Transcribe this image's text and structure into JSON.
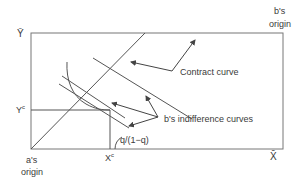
{
  "diagram": {
    "type": "edgeworth-box",
    "colors": {
      "line": "#555555",
      "text": "#3a3a3a",
      "background": "#ffffff"
    },
    "labels": {
      "y_bar": "Ȳ",
      "x_bar": "X̄",
      "y_c": "Y",
      "y_c_sup": "c",
      "x_c": "X",
      "x_c_sup": "c",
      "a_origin_line1": "a's",
      "a_origin_line2": "origin",
      "b_origin_line1": "b's",
      "b_origin_line2": "origin",
      "contract_curve": "Contract curve",
      "b_indifference": "b's indifference curves",
      "slope": "q/(1−q)"
    }
  }
}
